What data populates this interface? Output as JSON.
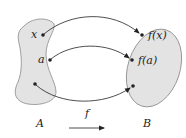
{
  "diagram": {
    "domain_set": {
      "label": "A",
      "fill": "#e3e3e3",
      "stroke": "#8a8a8a",
      "points": [
        {
          "label": "x"
        },
        {
          "label": "a"
        },
        {
          "label": ""
        }
      ]
    },
    "codomain_set": {
      "label": "B",
      "fill": "#e3e3e3",
      "stroke": "#8a8a8a",
      "points": [
        {
          "label": "f(x)"
        },
        {
          "label": "f(a)"
        },
        {
          "label": ""
        }
      ]
    },
    "function_label": "f",
    "arrow_color": "#222222"
  }
}
